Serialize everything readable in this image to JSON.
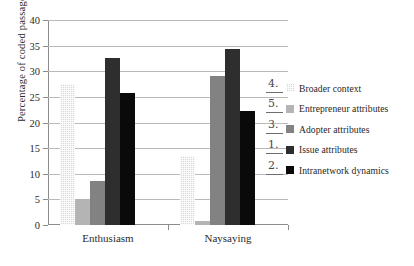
{
  "chart_data": {
    "type": "bar",
    "title": "",
    "xlabel": "",
    "ylabel": "Percentage of coded passages",
    "categories": [
      "Enthusiasm",
      "Naysaying"
    ],
    "ylim": [
      0,
      40
    ],
    "ytick_step": 5,
    "yticks": [
      "40",
      "35",
      "30",
      "25",
      "20",
      "15",
      "10",
      "5",
      "0"
    ],
    "grid": true,
    "legend_position": "right",
    "series": [
      {
        "name": "Broader context",
        "values": [
          27.5,
          13.4
        ],
        "color": "#d6d6d6",
        "pattern": "dotted"
      },
      {
        "name": "Entrepreneur attributes",
        "values": [
          5.0,
          0.8
        ],
        "color": "#b4b4b4",
        "pattern": "solid"
      },
      {
        "name": "Adopter attributes",
        "values": [
          8.5,
          29.0
        ],
        "color": "#828282",
        "pattern": "solid"
      },
      {
        "name": "Issue attributes",
        "values": [
          32.6,
          34.3
        ],
        "color": "#2e2e2e",
        "pattern": "solid"
      },
      {
        "name": "Intranetwork dynamics",
        "values": [
          25.8,
          22.3
        ],
        "color": "#0a0a0a",
        "pattern": "solid"
      }
    ],
    "annotations": [
      "4.",
      "5.",
      "3.",
      "1.",
      "2."
    ]
  }
}
